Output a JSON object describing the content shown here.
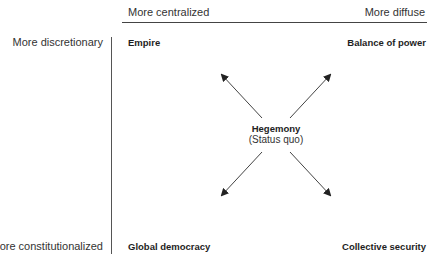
{
  "axes": {
    "top_left_label": "More centralized",
    "top_right_label": "More diffuse",
    "left_top_label": "More discretionary",
    "left_bottom_label": "More constitutionalized"
  },
  "corners": {
    "top_left": "Empire",
    "top_right": "Balance of power",
    "bottom_left": "Global democracy",
    "bottom_right": "Collective security"
  },
  "center": {
    "title": "Hegemony",
    "subtitle": "(Status quo)"
  },
  "colors": {
    "line": "#444444",
    "arrow": "#333333"
  }
}
